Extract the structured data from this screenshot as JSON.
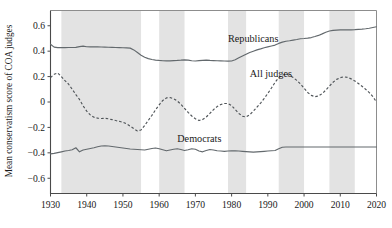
{
  "chart_data": {
    "type": "line",
    "title": "",
    "xlabel": "",
    "ylabel": "Mean conservatism score of COA judges",
    "xlim": [
      1930,
      2020
    ],
    "ylim": [
      -0.72,
      0.72
    ],
    "xticks": [
      1930,
      1940,
      1950,
      1960,
      1970,
      1980,
      1990,
      2000,
      2010,
      2020
    ],
    "xtick_labels": [
      "1930",
      "1940",
      "1950",
      "1960",
      "1970",
      "1980",
      "1990",
      "2000",
      "2010",
      "2020"
    ],
    "yticks": [
      0.6,
      0.4,
      0.2,
      0,
      -0.2,
      -0.4,
      -0.6
    ],
    "ytick_labels": [
      "0.6",
      "0.4",
      "0.2",
      "0",
      "−0.2",
      "−0.4",
      "−0.6"
    ],
    "grid": false,
    "legend_position": "inline-annotations",
    "shaded_bands": {
      "description": "vertical grey bands",
      "color": "#e3e3e3",
      "ranges": [
        [
          1933,
          1955
        ],
        [
          1960,
          1967
        ],
        [
          1979,
          1984
        ],
        [
          1993,
          2000
        ],
        [
          2007,
          2014
        ]
      ]
    },
    "series": [
      {
        "name": "Republicans",
        "style": "solid",
        "color": "#63696d",
        "annotation": "Republicans",
        "annotation_xy": [
          1979,
          0.47
        ],
        "x": [
          1930,
          1931,
          1932,
          1933,
          1934,
          1935,
          1936,
          1937,
          1938,
          1939,
          1940,
          1941,
          1942,
          1943,
          1944,
          1945,
          1946,
          1947,
          1948,
          1949,
          1950,
          1951,
          1952,
          1953,
          1954,
          1955,
          1956,
          1957,
          1958,
          1959,
          1960,
          1961,
          1962,
          1963,
          1964,
          1965,
          1966,
          1967,
          1968,
          1969,
          1970,
          1971,
          1972,
          1973,
          1974,
          1975,
          1976,
          1977,
          1978,
          1979,
          1980,
          1981,
          1982,
          1983,
          1984,
          1985,
          1986,
          1987,
          1988,
          1989,
          1990,
          1991,
          1992,
          1993,
          1994,
          1995,
          1996,
          1997,
          1998,
          1999,
          2000,
          2001,
          2002,
          2003,
          2004,
          2005,
          2006,
          2007,
          2008,
          2009,
          2010,
          2011,
          2012,
          2013,
          2014,
          2015,
          2016,
          2017,
          2018,
          2019,
          2020
        ],
        "values": [
          0.455,
          0.432,
          0.428,
          0.428,
          0.428,
          0.429,
          0.429,
          0.43,
          0.436,
          0.44,
          0.435,
          0.434,
          0.434,
          0.434,
          0.433,
          0.432,
          0.431,
          0.43,
          0.429,
          0.428,
          0.427,
          0.426,
          0.424,
          0.41,
          0.39,
          0.368,
          0.352,
          0.341,
          0.334,
          0.33,
          0.327,
          0.325,
          0.324,
          0.324,
          0.326,
          0.327,
          0.329,
          0.332,
          0.33,
          0.325,
          0.323,
          0.326,
          0.328,
          0.329,
          0.327,
          0.326,
          0.325,
          0.324,
          0.323,
          0.322,
          0.323,
          0.333,
          0.348,
          0.362,
          0.376,
          0.39,
          0.4,
          0.41,
          0.418,
          0.427,
          0.434,
          0.441,
          0.448,
          0.461,
          0.471,
          0.478,
          0.482,
          0.487,
          0.492,
          0.498,
          0.5,
          0.503,
          0.507,
          0.515,
          0.524,
          0.536,
          0.549,
          0.559,
          0.564,
          0.566,
          0.567,
          0.567,
          0.568,
          0.568,
          0.569,
          0.571,
          0.573,
          0.576,
          0.58,
          0.586,
          0.592
        ]
      },
      {
        "name": "All judges",
        "style": "dashed",
        "color": "#4f5458",
        "annotation": "All judges",
        "annotation_xy": [
          1985,
          0.195
        ],
        "x": [
          1930,
          1931,
          1932,
          1933,
          1934,
          1935,
          1936,
          1937,
          1938,
          1939,
          1940,
          1941,
          1942,
          1943,
          1944,
          1945,
          1946,
          1947,
          1948,
          1949,
          1950,
          1951,
          1952,
          1953,
          1954,
          1955,
          1956,
          1957,
          1958,
          1959,
          1960,
          1961,
          1962,
          1963,
          1964,
          1965,
          1966,
          1967,
          1968,
          1969,
          1970,
          1971,
          1972,
          1973,
          1974,
          1975,
          1976,
          1977,
          1978,
          1979,
          1980,
          1981,
          1982,
          1983,
          1984,
          1985,
          1986,
          1987,
          1988,
          1989,
          1990,
          1991,
          1992,
          1993,
          1994,
          1995,
          1996,
          1997,
          1998,
          1999,
          2000,
          2001,
          2002,
          2003,
          2004,
          2005,
          2006,
          2007,
          2008,
          2009,
          2010,
          2011,
          2012,
          2013,
          2014,
          2015,
          2016,
          2017,
          2018,
          2019,
          2020
        ],
        "values": [
          0.192,
          0.218,
          0.228,
          0.2,
          0.168,
          0.14,
          0.1,
          0.058,
          0.02,
          -0.03,
          -0.072,
          -0.102,
          -0.12,
          -0.127,
          -0.13,
          -0.128,
          -0.132,
          -0.139,
          -0.146,
          -0.152,
          -0.16,
          -0.172,
          -0.19,
          -0.21,
          -0.228,
          -0.22,
          -0.185,
          -0.145,
          -0.105,
          -0.062,
          -0.022,
          0.012,
          0.032,
          0.035,
          0.026,
          0.008,
          -0.018,
          -0.05,
          -0.082,
          -0.11,
          -0.132,
          -0.146,
          -0.138,
          -0.118,
          -0.09,
          -0.06,
          -0.036,
          -0.02,
          -0.012,
          -0.012,
          -0.028,
          -0.06,
          -0.09,
          -0.112,
          -0.118,
          -0.1,
          -0.072,
          -0.04,
          -0.008,
          0.028,
          0.068,
          0.11,
          0.155,
          0.192,
          0.212,
          0.218,
          0.21,
          0.192,
          0.17,
          0.142,
          0.108,
          0.075,
          0.052,
          0.042,
          0.047,
          0.066,
          0.094,
          0.125,
          0.155,
          0.178,
          0.192,
          0.198,
          0.194,
          0.182,
          0.166,
          0.146,
          0.124,
          0.1,
          0.074,
          0.042,
          0.0
        ]
      },
      {
        "name": "Democrats",
        "style": "solid",
        "color": "#63696d",
        "annotation": "Democrats",
        "annotation_xy": [
          1965,
          -0.315
        ],
        "x": [
          1930,
          1931,
          1932,
          1933,
          1934,
          1935,
          1936,
          1937,
          1938,
          1939,
          1940,
          1941,
          1942,
          1943,
          1944,
          1945,
          1946,
          1947,
          1948,
          1949,
          1950,
          1951,
          1952,
          1953,
          1954,
          1955,
          1956,
          1957,
          1958,
          1959,
          1960,
          1961,
          1962,
          1963,
          1964,
          1965,
          1966,
          1967,
          1968,
          1969,
          1970,
          1971,
          1972,
          1973,
          1974,
          1975,
          1976,
          1977,
          1978,
          1979,
          1980,
          1981,
          1982,
          1983,
          1984,
          1985,
          1986,
          1987,
          1988,
          1989,
          1990,
          1991,
          1992,
          1993,
          1994,
          1995,
          1996,
          1997,
          1998,
          1999,
          2000,
          2001,
          2002,
          2003,
          2004,
          2005,
          2006,
          2007,
          2008,
          2009,
          2010,
          2011,
          2012,
          2013,
          2014,
          2015,
          2016,
          2017,
          2018,
          2019,
          2020
        ],
        "values": [
          -0.408,
          -0.404,
          -0.398,
          -0.392,
          -0.386,
          -0.382,
          -0.376,
          -0.36,
          -0.392,
          -0.378,
          -0.372,
          -0.366,
          -0.36,
          -0.352,
          -0.346,
          -0.344,
          -0.346,
          -0.35,
          -0.354,
          -0.358,
          -0.362,
          -0.366,
          -0.37,
          -0.372,
          -0.374,
          -0.376,
          -0.378,
          -0.372,
          -0.366,
          -0.362,
          -0.368,
          -0.376,
          -0.384,
          -0.378,
          -0.372,
          -0.368,
          -0.374,
          -0.382,
          -0.376,
          -0.368,
          -0.372,
          -0.386,
          -0.392,
          -0.382,
          -0.374,
          -0.378,
          -0.384,
          -0.386,
          -0.388,
          -0.386,
          -0.384,
          -0.384,
          -0.386,
          -0.388,
          -0.39,
          -0.392,
          -0.394,
          -0.392,
          -0.39,
          -0.388,
          -0.386,
          -0.384,
          -0.382,
          -0.368,
          -0.356,
          -0.354,
          -0.354,
          -0.354,
          -0.354,
          -0.354,
          -0.354,
          -0.354,
          -0.354,
          -0.354,
          -0.354,
          -0.354,
          -0.354,
          -0.354,
          -0.354,
          -0.354,
          -0.354,
          -0.354,
          -0.354,
          -0.354,
          -0.354,
          -0.354,
          -0.354,
          -0.354,
          -0.354,
          -0.354,
          -0.354
        ]
      }
    ]
  }
}
